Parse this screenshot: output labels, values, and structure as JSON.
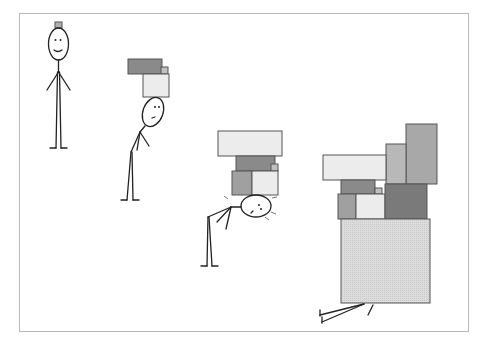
{
  "illustration": {
    "description": "Four-panel stick figure cartoon: a figure carrying progressively larger stacks of boxes on its head until crushed",
    "panels": [
      {
        "id": 1,
        "state": "standing, smiling, tiny box on head",
        "boxes": 1
      },
      {
        "id": 2,
        "state": "slightly bent, neutral face, two boxes on head",
        "boxes": 3
      },
      {
        "id": 3,
        "state": "bent over sideways, strained face with sweat marks",
        "boxes": 5
      },
      {
        "id": 4,
        "state": "crushed under a large pile, only legs visible",
        "boxes": 9
      }
    ]
  },
  "colors": {
    "frame": "#b8b8b8",
    "box_light": "#ececec",
    "box_mid": "#b0b0b0",
    "box_dark": "#8a8a8a",
    "box_darker": "#7a7a7a",
    "outline": "#222222"
  }
}
